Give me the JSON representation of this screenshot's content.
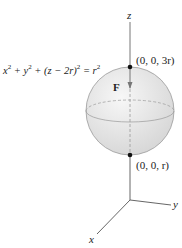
{
  "axes": {
    "z_label": "z",
    "y_label": "y",
    "x_label": "x"
  },
  "sphere": {
    "equation_parts": {
      "a": "x",
      "b": "2",
      "c": " + y",
      "d": "2",
      "e": " + (z − 2r)",
      "f": "2",
      "g": " = r",
      "h": "2"
    },
    "fill_color": "#e6e6e6",
    "outline_color": "#9a9a9a"
  },
  "points": {
    "top": "(0, 0, 3r)",
    "bottom": "(0, 0, r)"
  },
  "force": {
    "label": "F"
  }
}
